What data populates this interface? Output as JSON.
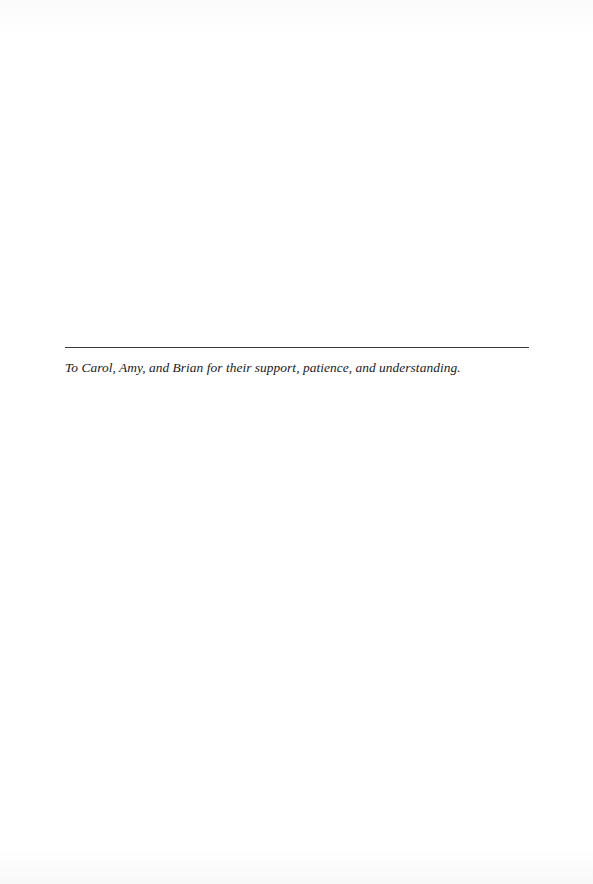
{
  "page": {
    "dedication": {
      "text": "To Carol, Amy, and Brian for their support, patience, and understanding."
    }
  }
}
